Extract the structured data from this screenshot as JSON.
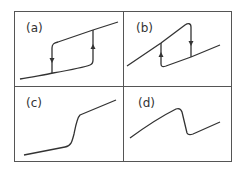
{
  "figure": {
    "panels": [
      {
        "id": "a",
        "label": "(a)",
        "description": "Hysteresis loop: lower branch rising slowly, jump up (arrow up) at right; upper branch, jump down (arrow down) at left"
      },
      {
        "id": "b",
        "label": "(b)",
        "description": "Reverse hysteresis loop: rising line, drop down (arrow down) at right, jump up (arrow up) at left"
      },
      {
        "id": "c",
        "label": "(c)",
        "description": "Monotonic S-shaped curve with steep rise in the middle"
      },
      {
        "id": "d",
        "label": "(d)",
        "description": "Curve rising to a peak, sharp drop, then rising again"
      }
    ]
  }
}
